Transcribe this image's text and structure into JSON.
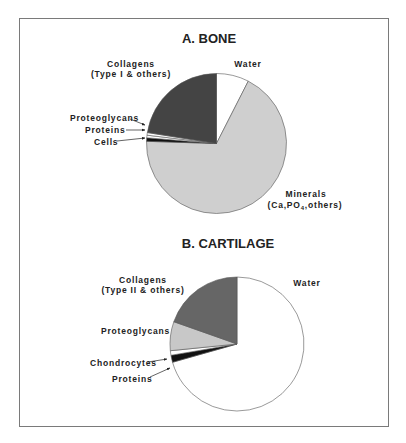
{
  "chart_data": [
    {
      "type": "pie",
      "title": "A. BONE",
      "start_angle": "12 o'clock, clockwise",
      "slices": [
        {
          "name": "Water",
          "label_lines": [
            "Water"
          ],
          "value": 7.5,
          "color": "#ffffff"
        },
        {
          "name": "Minerals",
          "label_lines": [
            "Minerals",
            "(Ca,PO4,others)"
          ],
          "value": 68.0,
          "color": "#cfcfcf"
        },
        {
          "name": "Cells",
          "label_lines": [
            "Cells"
          ],
          "value": 0.8,
          "color": "#111111"
        },
        {
          "name": "Proteins",
          "label_lines": [
            "Proteins"
          ],
          "value": 0.6,
          "color": "#ffffff"
        },
        {
          "name": "Proteoglycans",
          "label_lines": [
            "Proteoglycans"
          ],
          "value": 0.6,
          "color": "#ffffff"
        },
        {
          "name": "Collagens",
          "label_lines": [
            "Collagens",
            "(Type I & others)"
          ],
          "value": 22.5,
          "color": "#444444"
        }
      ]
    },
    {
      "type": "pie",
      "title": "B.  CARTILAGE",
      "start_angle": "12 o'clock, clockwise",
      "slices": [
        {
          "name": "Water",
          "label_lines": [
            "Water"
          ],
          "value": 70.6,
          "color": "#ffffff"
        },
        {
          "name": "Proteins",
          "label_lines": [
            "Proteins"
          ],
          "value": 1.7,
          "color": "#111111"
        },
        {
          "name": "Chondrocytes",
          "label_lines": [
            "Chondrocytes"
          ],
          "value": 1.1,
          "color": "#ffffff"
        },
        {
          "name": "Proteoglycans",
          "label_lines": [
            "Proteoglycans"
          ],
          "value": 7.0,
          "color": "#c8c8c8"
        },
        {
          "name": "Collagens",
          "label_lines": [
            "Collagens",
            "(Type II & others)"
          ],
          "value": 19.6,
          "color": "#666666"
        }
      ]
    }
  ],
  "bone": {
    "title": "A. BONE",
    "labels": {
      "collagens_1": "Collagens",
      "collagens_2": "(Type I & others)",
      "water": "Water",
      "proteoglycans": "Proteoglycans",
      "proteins": "Proteins",
      "cells": "Cells",
      "minerals_1": "Minerals",
      "minerals_2a": "(Ca,PO",
      "minerals_2sub": "4",
      "minerals_2b": ",others)"
    }
  },
  "cartilage": {
    "title": "B.  CARTILAGE",
    "labels": {
      "collagens_1": "Collagens",
      "collagens_2": "(Type II & others)",
      "water": "Water",
      "proteoglycans": "Proteoglycans",
      "chondrocytes": "Chondrocytes",
      "proteins": "Proteins"
    }
  }
}
